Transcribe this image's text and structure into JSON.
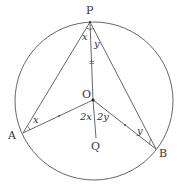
{
  "diagram": {
    "colors": {
      "stroke": "#555555",
      "text": "#333333",
      "background": "#ffffff"
    },
    "circle": {
      "cx": 94,
      "cy": 101,
      "r": 79
    },
    "points": {
      "P": {
        "label": "P",
        "x": 90,
        "y": 22
      },
      "O": {
        "label": "O",
        "x": 93,
        "y": 100
      },
      "A": {
        "label": "A",
        "x": 23,
        "y": 133
      },
      "B": {
        "label": "B",
        "x": 156,
        "y": 149
      },
      "Q": {
        "label": "Q",
        "x": 96,
        "y": 140
      }
    },
    "angle_labels": {
      "apx": "x",
      "bpy": "y",
      "pax": "x",
      "pby": "y",
      "aoq": "2x",
      "boq": "2y"
    },
    "equal_marks": {
      "po": "=",
      "oa": "•",
      "ob": "•"
    }
  }
}
